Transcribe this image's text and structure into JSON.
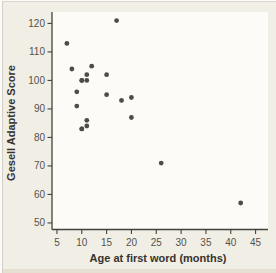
{
  "chart_data": {
    "type": "scatter",
    "title": "",
    "xlabel": "Age at first word (months)",
    "ylabel": "Gesell Adaptive Score",
    "x_ticks": [
      5,
      10,
      15,
      20,
      25,
      30,
      35,
      40,
      45
    ],
    "y_ticks": [
      50,
      60,
      70,
      80,
      90,
      100,
      110,
      120
    ],
    "xlim": [
      4.0,
      47.5
    ],
    "ylim": [
      47.7,
      124.0
    ],
    "grid": false,
    "legend": "none",
    "points": [
      {
        "x": 15,
        "y": 95
      },
      {
        "x": 26,
        "y": 71
      },
      {
        "x": 10,
        "y": 83
      },
      {
        "x": 9,
        "y": 91
      },
      {
        "x": 15,
        "y": 102
      },
      {
        "x": 20,
        "y": 87
      },
      {
        "x": 18,
        "y": 93
      },
      {
        "x": 11,
        "y": 100
      },
      {
        "x": 8,
        "y": 104
      },
      {
        "x": 20,
        "y": 94
      },
      {
        "x": 7,
        "y": 113
      },
      {
        "x": 9,
        "y": 96
      },
      {
        "x": 10,
        "y": 83
      },
      {
        "x": 11,
        "y": 84
      },
      {
        "x": 11,
        "y": 102
      },
      {
        "x": 10,
        "y": 100
      },
      {
        "x": 12,
        "y": 105
      },
      {
        "x": 42,
        "y": 57
      },
      {
        "x": 17,
        "y": 121
      },
      {
        "x": 11,
        "y": 86
      },
      {
        "x": 10,
        "y": 100
      }
    ],
    "colors": {
      "point": "#4f4c47",
      "axis": "#44413c",
      "tick_label": "#55524d",
      "axis_title": "#36332e",
      "background": "#f1eee6",
      "plot_background": "#fcfbf8"
    }
  }
}
